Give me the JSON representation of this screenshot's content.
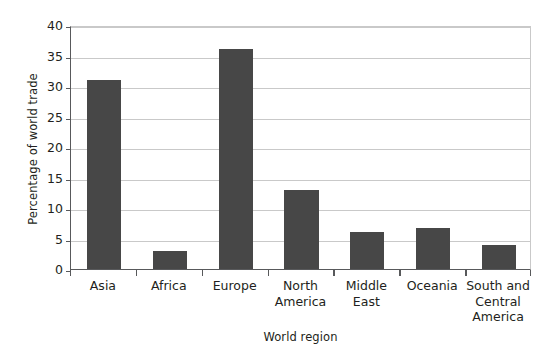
{
  "chart_data": {
    "type": "bar",
    "title": "",
    "xlabel": "World region",
    "ylabel": "Percentage of world trade",
    "categories": [
      "Asia",
      "Africa",
      "Europe",
      "North America",
      "Middle East",
      "Oceania",
      "South and Central America"
    ],
    "category_lines": [
      [
        "Asia"
      ],
      [
        "Africa"
      ],
      [
        "Europe"
      ],
      [
        "North",
        "America"
      ],
      [
        "Middle",
        "East"
      ],
      [
        "Oceania"
      ],
      [
        "South and",
        "Central",
        "America"
      ]
    ],
    "values": [
      31,
      3,
      36,
      13,
      6,
      6.7,
      4
    ],
    "ylim": [
      0,
      40
    ],
    "ytick_labels": [
      "0",
      "5",
      "10",
      "15",
      "20",
      "25",
      "30",
      "35",
      "40"
    ],
    "ytick_values": [
      0,
      5,
      10,
      15,
      20,
      25,
      30,
      35,
      40
    ],
    "grid": true,
    "legend": false,
    "bar_color": "#474747",
    "gridline_color": "#c9c9c9",
    "axis_color": "#58595b",
    "text_color": "#231f20",
    "background_color": "#ffffff"
  }
}
